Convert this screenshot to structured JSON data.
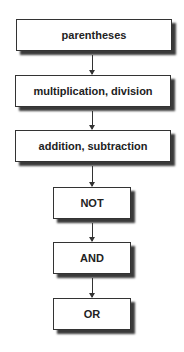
{
  "diagram": {
    "type": "flowchart",
    "title": "",
    "steps": [
      {
        "label": "parentheses"
      },
      {
        "label": "multiplication, division"
      },
      {
        "label": "addition, subtraction"
      },
      {
        "label": "NOT"
      },
      {
        "label": "AND"
      },
      {
        "label": "OR"
      }
    ],
    "edges": [
      {
        "from": 0,
        "to": 1
      },
      {
        "from": 1,
        "to": 2
      },
      {
        "from": 2,
        "to": 3
      },
      {
        "from": 3,
        "to": 4
      },
      {
        "from": 4,
        "to": 5
      }
    ]
  }
}
